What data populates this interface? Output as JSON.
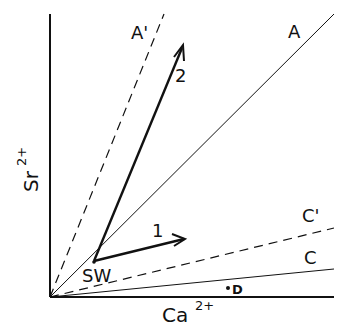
{
  "diagram": {
    "axes": {
      "x_label": "Ca",
      "x_superscript": "2+",
      "y_label": "Sr",
      "y_superscript": "2+"
    },
    "lines": [
      {
        "id": "A_prime",
        "label": "A'",
        "style": "dashed"
      },
      {
        "id": "A",
        "label": "A",
        "style": "solid"
      },
      {
        "id": "C_prime",
        "label": "C'",
        "style": "dashed"
      },
      {
        "id": "C",
        "label": "C",
        "style": "solid"
      }
    ],
    "arrows": [
      {
        "id": "1",
        "label": "1"
      },
      {
        "id": "2",
        "label": "2"
      }
    ],
    "points": [
      {
        "id": "SW",
        "label": "SW"
      },
      {
        "id": "D",
        "label": "D"
      }
    ],
    "colors": {
      "ink": "#111111",
      "background": "#ffffff"
    }
  }
}
